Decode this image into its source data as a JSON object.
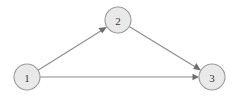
{
  "diagram": {
    "type": "directed-graph",
    "canvas": {
      "width": 235,
      "height": 98,
      "background": "#ffffff"
    },
    "style": {
      "node_fill": "#e9e9e9",
      "node_stroke": "#9a9a9a",
      "node_radius": 13,
      "edge_color": "#8c8c8c",
      "arrow_color": "#6f6f6f",
      "label_color": "#3a3a3a"
    },
    "nodes": [
      {
        "id": "1",
        "label": "1",
        "cx": 27,
        "cy": 77,
        "r": 13
      },
      {
        "id": "2",
        "label": "2",
        "cx": 118,
        "cy": 20,
        "r": 13
      },
      {
        "id": "3",
        "label": "3",
        "cx": 212,
        "cy": 77,
        "r": 13
      }
    ],
    "edges": [
      {
        "id": "e1",
        "from": "1",
        "to": "2",
        "directed": true,
        "label": ""
      },
      {
        "id": "e2",
        "from": "2",
        "to": "3",
        "directed": true,
        "label": ""
      },
      {
        "id": "e3",
        "from": "1",
        "to": "3",
        "directed": true,
        "label": ""
      }
    ]
  }
}
